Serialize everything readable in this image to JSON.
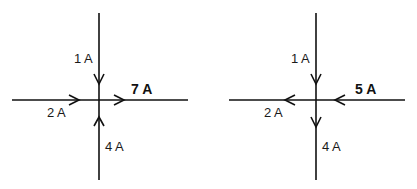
{
  "diagrams": [
    {
      "id": "left-junction",
      "branches": [
        {
          "position": "top",
          "label": "1 A",
          "direction": "into-junction"
        },
        {
          "position": "left",
          "label": "2 A",
          "direction": "into-junction"
        },
        {
          "position": "right",
          "label": "7 A",
          "direction": "out-of-junction",
          "emphasis": "bold"
        },
        {
          "position": "bottom",
          "label": "4 A",
          "direction": "into-junction"
        }
      ]
    },
    {
      "id": "right-junction",
      "branches": [
        {
          "position": "top",
          "label": "1 A",
          "direction": "into-junction"
        },
        {
          "position": "left",
          "label": "2 A",
          "direction": "out-of-junction"
        },
        {
          "position": "right",
          "label": "5 A",
          "direction": "into-junction",
          "emphasis": "bold"
        },
        {
          "position": "bottom",
          "label": "4 A",
          "direction": "out-of-junction"
        }
      ]
    }
  ],
  "colors": {
    "line": "#111111",
    "background": "#ffffff"
  }
}
